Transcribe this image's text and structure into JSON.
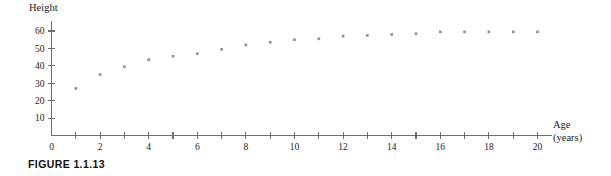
{
  "figure": {
    "caption": "FIGURE 1.1.13"
  },
  "chart_data": {
    "type": "scatter",
    "title": "",
    "xlabel": "Age",
    "xlabel_unit": "(years)",
    "ylabel": "Height",
    "xlim": [
      0,
      20.6
    ],
    "ylim": [
      0,
      66
    ],
    "grid": false,
    "legend": "none",
    "x_ticks": [
      0,
      1,
      2,
      3,
      4,
      5,
      6,
      7,
      8,
      9,
      10,
      11,
      12,
      13,
      14,
      15,
      16,
      17,
      18,
      19,
      20
    ],
    "x_tick_labels": [
      "0",
      "",
      "2",
      "",
      "4",
      "",
      "6",
      "",
      "8",
      "",
      "10",
      "",
      "12",
      "",
      "14",
      "",
      "16",
      "",
      "18",
      "",
      "20"
    ],
    "y_ticks": [
      10,
      20,
      30,
      40,
      50,
      60
    ],
    "y_tick_labels": [
      "10",
      "20",
      "30",
      "40",
      "50",
      "60"
    ],
    "x": [
      1,
      2,
      3,
      4,
      5,
      6,
      7,
      8,
      9,
      10,
      11,
      12,
      13,
      14,
      15,
      16,
      17,
      18,
      19,
      20
    ],
    "values": [
      27,
      35,
      39.5,
      43.5,
      45.5,
      47,
      49.5,
      52,
      53.5,
      55,
      55.5,
      57,
      57.5,
      58,
      58.5,
      59.5,
      59.5,
      59.5,
      59.5,
      59.5
    ]
  }
}
